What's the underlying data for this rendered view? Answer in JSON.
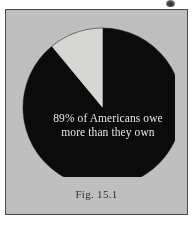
{
  "figure": {
    "caption": "Fig. 15.1",
    "frame_color": "#4a4a4a",
    "background_color": "#c2c2c2"
  },
  "chart_data": {
    "type": "pie",
    "title": "",
    "subtitle": "",
    "xlabel": "",
    "ylabel": "",
    "legend_position": "none",
    "grid": false,
    "start_angle_deg": 0,
    "direction": "counterclockwise",
    "categories": [
      "Americans who owe more than they own",
      "Americans who own more than they owe"
    ],
    "values": [
      89,
      11
    ],
    "units": "percent",
    "colors": [
      "#0b0b0b",
      "#d6d6d2"
    ],
    "annotations": [
      {
        "target": "Americans who owe more than they own",
        "text_lines": [
          "89% of Americans owe",
          "more than they own"
        ],
        "text_color": "#e8e8e4",
        "placement": "inside-slice"
      }
    ]
  },
  "labels": {
    "line1": "89% of Americans owe",
    "line2": "more than they own"
  },
  "icons": {
    "scan_artifact": "smudge-icon"
  }
}
